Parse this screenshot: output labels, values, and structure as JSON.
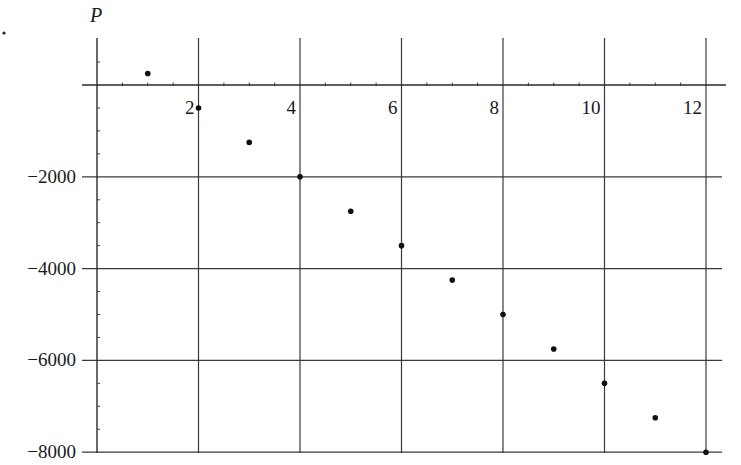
{
  "chart_data": {
    "type": "scatter",
    "title": "",
    "xlabel": "",
    "ylabel": "P",
    "x": [
      1,
      2,
      3,
      4,
      5,
      6,
      7,
      8,
      9,
      10,
      11,
      12
    ],
    "values": [
      250,
      -500,
      -1250,
      -2000,
      -2750,
      -3500,
      -4250,
      -5000,
      -5750,
      -6500,
      -7250,
      -8000
    ],
    "series": [
      {
        "name": "P",
        "x": [
          1,
          2,
          3,
          4,
          5,
          6,
          7,
          8,
          9,
          10,
          11,
          12
        ],
        "values": [
          250,
          -500,
          -1250,
          -2000,
          -2750,
          -3500,
          -4250,
          -5000,
          -5750,
          -6500,
          -7250,
          -8000
        ]
      }
    ],
    "xlim": [
      0,
      12.3
    ],
    "ylim": [
      -8000,
      550
    ],
    "x_ticks": [
      2,
      4,
      6,
      8,
      10,
      12
    ],
    "x_tick_labels": [
      "2",
      "4",
      "6",
      "8",
      "10",
      "12"
    ],
    "x_minor_step": 0.5,
    "y_ticks": [
      -2000,
      -4000,
      -6000,
      -8000
    ],
    "y_tick_labels": [
      "−2000",
      "−4000",
      "−6000",
      "−8000"
    ],
    "y_minor_step": 500,
    "grid": true,
    "legend": null
  },
  "layout": {
    "origin_px": [
      97,
      85
    ],
    "x_px_per_unit": 50.75,
    "y_px_per_unit": 0.0459,
    "plot_right_px": 722,
    "plot_top_px": 38,
    "plot_bottom_px": 453,
    "ylabel_pos": [
      90,
      22
    ],
    "stray_dot": [
      4,
      33
    ]
  }
}
